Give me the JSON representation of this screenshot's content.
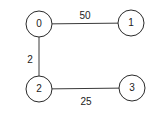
{
  "graph": {
    "nodes": [
      {
        "id": "0",
        "label": "0",
        "cx": 39,
        "cy": 24
      },
      {
        "id": "1",
        "label": "1",
        "cx": 131,
        "cy": 23
      },
      {
        "id": "2",
        "label": "2",
        "cx": 39,
        "cy": 89
      },
      {
        "id": "3",
        "label": "3",
        "cx": 132,
        "cy": 88
      }
    ],
    "edges": [
      {
        "from": "0",
        "to": "1",
        "weight": "50",
        "label_x": 85,
        "label_y": 16
      },
      {
        "from": "0",
        "to": "2",
        "weight": "2",
        "label_x": 30,
        "label_y": 60
      },
      {
        "from": "2",
        "to": "3",
        "weight": "25",
        "label_x": 86,
        "label_y": 102
      }
    ],
    "node_radius": 13,
    "colors": {
      "stroke": "#2a2a2a",
      "text": "#222222",
      "background": "#ffffff"
    }
  }
}
